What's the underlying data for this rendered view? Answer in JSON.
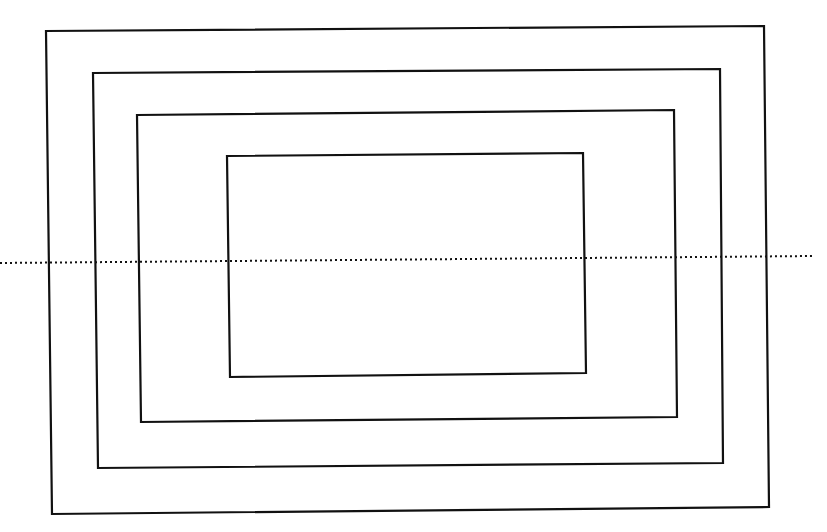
{
  "diagram": {
    "title": "",
    "background": "#ffffff",
    "stroke_color": "#111111",
    "rectangles": [
      {
        "id": "outer",
        "points": [
          [
            46,
            31
          ],
          [
            764,
            26
          ],
          [
            769,
            507
          ],
          [
            52,
            514
          ]
        ],
        "stroke_width": 2.2
      },
      {
        "id": "second",
        "points": [
          [
            93,
            73
          ],
          [
            720,
            69
          ],
          [
            723,
            463
          ],
          [
            98,
            468
          ]
        ],
        "stroke_width": 2.2
      },
      {
        "id": "third",
        "points": [
          [
            137,
            115
          ],
          [
            674,
            110
          ],
          [
            677,
            417
          ],
          [
            141,
            422
          ]
        ],
        "stroke_width": 2.2
      },
      {
        "id": "inner",
        "points": [
          [
            227,
            156
          ],
          [
            583,
            153
          ],
          [
            586,
            373
          ],
          [
            230,
            377
          ]
        ],
        "stroke_width": 2.2
      }
    ],
    "dotted_line": {
      "x1": 0,
      "y1": 263,
      "x2": 814,
      "y2": 256,
      "stroke_width": 2,
      "dash": "2 3"
    }
  }
}
